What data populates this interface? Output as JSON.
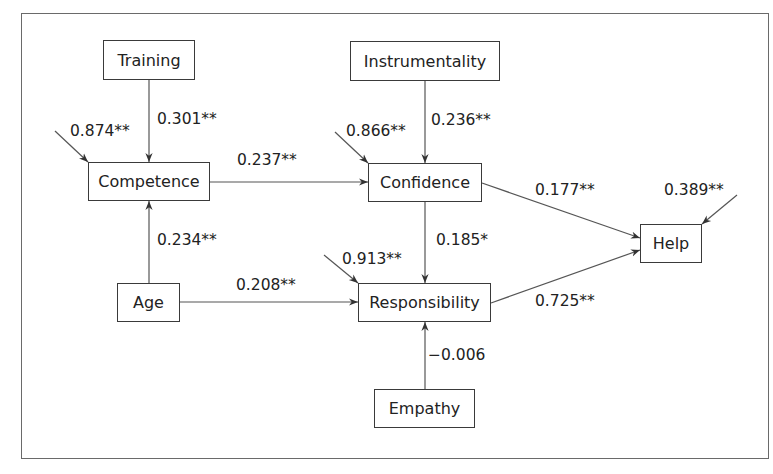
{
  "diagram": {
    "type": "path-model",
    "nodes": {
      "training": "Training",
      "competence": "Competence",
      "instrumentality": "Instrumentality",
      "confidence": "Confidence",
      "help": "Help",
      "age": "Age",
      "responsibility": "Responsibility",
      "empathy": "Empathy"
    },
    "edges": {
      "training_competence": "0.301**",
      "competence_confidence": "0.237**",
      "instrumentality_confidence": "0.236**",
      "age_competence": "0.234**",
      "age_responsibility": "0.208**",
      "confidence_responsibility": "0.185*",
      "confidence_help": "0.177**",
      "responsibility_help": "0.725**",
      "empathy_responsibility": "−0.006"
    },
    "residuals": {
      "competence": "0.874**",
      "confidence": "0.866**",
      "responsibility": "0.913**",
      "help": "0.389**"
    },
    "edge_list": [
      {
        "from": "Training",
        "to": "Competence",
        "coef": "0.301**"
      },
      {
        "from": "Competence",
        "to": "Confidence",
        "coef": "0.237**"
      },
      {
        "from": "Instrumentality",
        "to": "Confidence",
        "coef": "0.236**"
      },
      {
        "from": "Age",
        "to": "Competence",
        "coef": "0.234**"
      },
      {
        "from": "Age",
        "to": "Responsibility",
        "coef": "0.208**"
      },
      {
        "from": "Confidence",
        "to": "Responsibility",
        "coef": "0.185*"
      },
      {
        "from": "Confidence",
        "to": "Help",
        "coef": "0.177**"
      },
      {
        "from": "Responsibility",
        "to": "Help",
        "coef": "0.725**"
      },
      {
        "from": "Empathy",
        "to": "Responsibility",
        "coef": "−0.006"
      }
    ],
    "colors": {
      "line": "#3a3a3a",
      "frame": "#6a6a6a",
      "background": "#ffffff"
    }
  }
}
